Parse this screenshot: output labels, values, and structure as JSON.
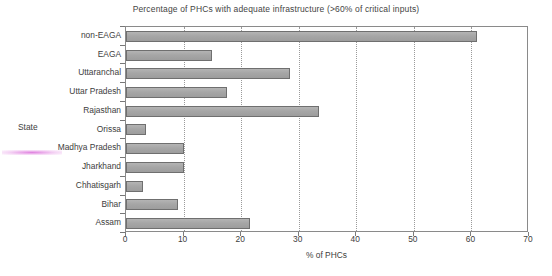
{
  "chart_data": {
    "type": "bar",
    "orientation": "horizontal",
    "title": "Percentage of PHCs with adequate infrastructure (>60% of critical inputs)",
    "xlabel": "% of PHCs",
    "ylabel": "State",
    "categories": [
      "Assam",
      "Bihar",
      "Chhatisgarh",
      "Jharkhand",
      "Madhya Pradesh",
      "Orissa",
      "Rajasthan",
      "Uttar Pradesh",
      "Uttaranchal",
      "EAGA",
      "non-EAGA"
    ],
    "values": [
      21.5,
      9,
      3,
      10,
      10,
      3.5,
      33.5,
      17.5,
      28.5,
      15,
      61
    ],
    "xlim": [
      0,
      70
    ],
    "xticks": [
      0,
      10,
      20,
      30,
      40,
      50,
      60,
      70
    ],
    "xtick_labels": [
      "0",
      "10",
      "20",
      "30",
      "40",
      "50",
      "60",
      "70"
    ],
    "grid": "vertical-dotted",
    "legend": "none",
    "bar_color": "#a9a9a9",
    "bar_border_color": "#6f6f6f",
    "frame_color": "#8a8a8a",
    "gridline_color": "#9a9a9a",
    "text_color": "#3d3d3d"
  }
}
